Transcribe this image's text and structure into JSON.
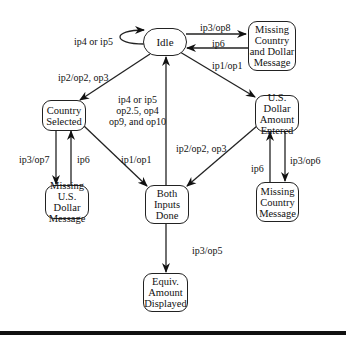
{
  "diagram": {
    "type": "state-transition",
    "nodes": {
      "idle": "Idle",
      "missing_country_dollar": "Missing\nCountry\nand Dollar\nMessage",
      "country_selected": "Country\nSelected",
      "usd_entered": "U.S. Dollar\nAmount\nEntered",
      "missing_usd": "Missing\nU.S. Dollar\nMessage",
      "both_inputs": "Both\nInputs\nDone",
      "missing_country": "Missing\nCountry\nMessage",
      "equiv_displayed": "Equiv.\nAmount\nDisplayed"
    },
    "edges": {
      "idle_self": "ip4 or ip5",
      "idle_to_missing_cd": "ip3/op8",
      "missing_cd_to_idle": "ip6",
      "idle_to_usd": "ip1/op1",
      "idle_to_country": "ip2/op2, op3",
      "both_to_idle": "ip4 or ip5\nop2.5, op4\nop9, and op10",
      "country_to_missing_usd": "ip3/op7",
      "missing_usd_to_country": "ip6",
      "country_to_both": "ip1/op1",
      "usd_to_both": "ip2/op2, op3",
      "missing_country_to_usd": "ip6",
      "usd_to_missing_country": "ip3/op6",
      "both_to_equiv": "ip3/op5"
    }
  }
}
